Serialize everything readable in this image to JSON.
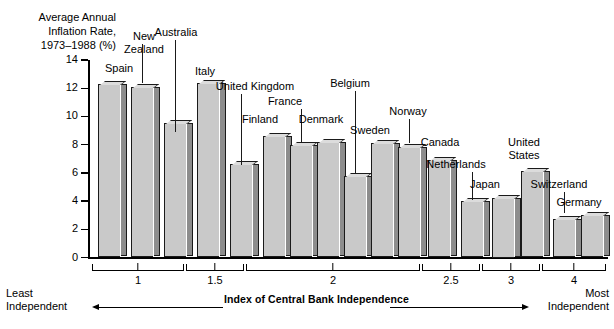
{
  "chart_data": {
    "type": "bar",
    "title": "Average Annual\nInflation Rate,\n1973–1988 (%)",
    "ylabel": "Average Annual Inflation Rate, 1973-1988 (%)",
    "xlabel": "Index of Central Bank Independence",
    "ylim": [
      0,
      14
    ],
    "ytick_labels": [
      "14",
      "12",
      "10",
      "8",
      "6",
      "4",
      "2",
      "0"
    ],
    "ytick_values": [
      14,
      12,
      10,
      8,
      6,
      4,
      2,
      0
    ],
    "grid": false,
    "legend": null,
    "categories": [
      "Spain",
      "New Zealand",
      "Australia",
      "Italy",
      "United Kingdom",
      "Finland",
      "France",
      "Denmark",
      "Belgium",
      "Sweden",
      "Norway",
      "Canada",
      "Netherlands",
      "Japan",
      "United States",
      "Switzerland",
      "Germany"
    ],
    "values": [
      12.3,
      12.1,
      9.5,
      12.4,
      6.6,
      8.6,
      8.0,
      8.2,
      5.8,
      8.1,
      7.8,
      6.9,
      4.0,
      4.2,
      6.1,
      2.7,
      3.0
    ],
    "x_group_labels": [
      "1",
      "1.5",
      "2",
      "2.5",
      "3",
      "4"
    ],
    "annotations": {
      "left_end": "Least\nIndependent",
      "right_end": "Most\nIndependent"
    },
    "colors": {
      "bar_face": "#c9c9c9",
      "bar_side": "#8d8d8d",
      "bar_top": "#dcdcdc",
      "outline": "#1a1a1a",
      "background": "#ffffff"
    }
  },
  "bars": [
    {
      "label": "Spain",
      "value": 12.3,
      "x": 98,
      "w": 22
    },
    {
      "label": "New Zealand",
      "value": 12.1,
      "x": 131,
      "w": 22
    },
    {
      "label": "Australia",
      "value": 9.5,
      "x": 164,
      "w": 22
    },
    {
      "label": "Italy",
      "value": 12.4,
      "x": 197,
      "w": 22
    },
    {
      "label": "United Kingdom",
      "value": 6.6,
      "x": 230,
      "w": 22
    },
    {
      "label": "Finland",
      "value": 8.6,
      "x": 263,
      "w": 22
    },
    {
      "label": "France",
      "value": 8.0,
      "x": 290,
      "w": 22
    },
    {
      "label": "Denmark",
      "value": 8.2,
      "x": 317,
      "w": 22
    },
    {
      "label": "Belgium",
      "value": 5.8,
      "x": 344,
      "w": 22
    },
    {
      "label": "Sweden",
      "value": 8.1,
      "x": 371,
      "w": 22
    },
    {
      "label": "Norway",
      "value": 7.8,
      "x": 398,
      "w": 22
    },
    {
      "label": "Canada",
      "value": 6.9,
      "x": 428,
      "w": 22
    },
    {
      "label": "Netherlands",
      "value": 4.0,
      "x": 461,
      "w": 22
    },
    {
      "label": "Japan",
      "value": 4.2,
      "x": 492,
      "w": 22
    },
    {
      "label": "United States",
      "value": 6.1,
      "x": 521,
      "w": 22
    },
    {
      "label": "Switzerland",
      "value": 2.7,
      "x": 553,
      "w": 22
    },
    {
      "label": "Germany",
      "value": 3.0,
      "x": 581,
      "w": 22
    }
  ],
  "axis": {
    "ticks": [
      {
        "label": "14",
        "value": 14
      },
      {
        "label": "12",
        "value": 12
      },
      {
        "label": "10",
        "value": 10
      },
      {
        "label": "8",
        "value": 8
      },
      {
        "label": "6",
        "value": 6
      },
      {
        "label": "4",
        "value": 4
      },
      {
        "label": "2",
        "value": 2
      },
      {
        "label": "0",
        "value": 0
      }
    ]
  },
  "groups": [
    {
      "label": "1",
      "x": 92,
      "w": 92
    },
    {
      "label": "1.5",
      "x": 186,
      "w": 58
    },
    {
      "label": "2",
      "x": 246,
      "w": 174
    },
    {
      "label": "2.5",
      "x": 422,
      "w": 58
    },
    {
      "label": "3",
      "x": 482,
      "w": 58
    },
    {
      "label": "4",
      "x": 542,
      "w": 64
    }
  ],
  "labels": {
    "ytitle": "Average Annual\nInflation Rate,\n1973–1988 (%)",
    "xtitle": "Index of Central Bank Independence",
    "least": "Least\nIndependent",
    "most": "Most\nIndependent"
  }
}
